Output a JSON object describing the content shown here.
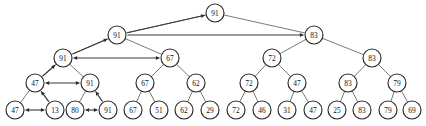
{
  "figure": {
    "name": "binary-heap-percolate-diagram",
    "background": "#ffffff",
    "node_fill": "#ffffff",
    "node_stroke": "#2b2b2b",
    "edge_color": "#6b6b6b",
    "arrow_color": "#2b2b2b",
    "node_radius": 9,
    "width": 426,
    "height": 126
  },
  "nodes": [
    {
      "id": "n0",
      "label": "91",
      "x": 215,
      "y": 13,
      "level": 1
    },
    {
      "id": "n1",
      "label": "91",
      "x": 117,
      "y": 35,
      "level": 2
    },
    {
      "id": "n2",
      "label": "83",
      "x": 314,
      "y": 35,
      "level": 2
    },
    {
      "id": "n3",
      "label": "91",
      "x": 63,
      "y": 58,
      "level": 3
    },
    {
      "id": "n4",
      "label": "67",
      "x": 170,
      "y": 58,
      "level": 3
    },
    {
      "id": "n5",
      "label": "72",
      "x": 272,
      "y": 58,
      "level": 3
    },
    {
      "id": "n6",
      "label": "83",
      "x": 372,
      "y": 58,
      "level": 3
    },
    {
      "id": "n7",
      "label": "47",
      "x": 35,
      "y": 83,
      "level": 4
    },
    {
      "id": "n8",
      "label": "91",
      "x": 90,
      "y": 83,
      "level": 4
    },
    {
      "id": "n9",
      "label": "67",
      "x": 145,
      "y": 83,
      "level": 4
    },
    {
      "id": "n10",
      "label": "62",
      "x": 196,
      "y": 83,
      "level": 4
    },
    {
      "id": "n11",
      "label": "72",
      "x": 249,
      "y": 83,
      "level": 4
    },
    {
      "id": "n12",
      "label": "47",
      "x": 297,
      "y": 83,
      "level": 4
    },
    {
      "id": "n13",
      "label": "83",
      "x": 348,
      "y": 83,
      "level": 4
    },
    {
      "id": "n14",
      "label": "79",
      "x": 397,
      "y": 83,
      "level": 4
    },
    {
      "id": "n15",
      "label": "47",
      "x": 15,
      "y": 110,
      "level": 5
    },
    {
      "id": "n16",
      "label": "13",
      "x": 55,
      "y": 110,
      "level": 5
    },
    {
      "id": "n17",
      "label": "80",
      "x": 75,
      "y": 110,
      "level": 5
    },
    {
      "id": "n18",
      "label": "91",
      "x": 108,
      "y": 110,
      "level": 5
    },
    {
      "id": "n19",
      "label": "67",
      "x": 133,
      "y": 110,
      "level": 5
    },
    {
      "id": "n20",
      "label": "51",
      "x": 159,
      "y": 110,
      "level": 5
    },
    {
      "id": "n21",
      "label": "62",
      "x": 184,
      "y": 110,
      "level": 5
    },
    {
      "id": "n22",
      "label": "29",
      "x": 210,
      "y": 110,
      "level": 5
    },
    {
      "id": "n23",
      "label": "72",
      "x": 236,
      "y": 110,
      "level": 5
    },
    {
      "id": "n24",
      "label": "46",
      "x": 262,
      "y": 110,
      "level": 5
    },
    {
      "id": "n25",
      "label": "31",
      "x": 287,
      "y": 110,
      "level": 5
    },
    {
      "id": "n26",
      "label": "47",
      "x": 313,
      "y": 110,
      "level": 5
    },
    {
      "id": "n27",
      "label": "25",
      "x": 337,
      "y": 110,
      "level": 5
    },
    {
      "id": "n28",
      "label": "83",
      "x": 362,
      "y": 110,
      "level": 5
    },
    {
      "id": "n29",
      "label": "79",
      "x": 388,
      "y": 110,
      "level": 5
    },
    {
      "id": "n30",
      "label": "69",
      "x": 412,
      "y": 110,
      "level": 5
    }
  ],
  "edges": [
    {
      "from": "n0",
      "to": "n1"
    },
    {
      "from": "n0",
      "to": "n2"
    },
    {
      "from": "n1",
      "to": "n3"
    },
    {
      "from": "n1",
      "to": "n4"
    },
    {
      "from": "n2",
      "to": "n5"
    },
    {
      "from": "n2",
      "to": "n6"
    },
    {
      "from": "n3",
      "to": "n7"
    },
    {
      "from": "n3",
      "to": "n8"
    },
    {
      "from": "n4",
      "to": "n9"
    },
    {
      "from": "n4",
      "to": "n10"
    },
    {
      "from": "n5",
      "to": "n11"
    },
    {
      "from": "n5",
      "to": "n12"
    },
    {
      "from": "n6",
      "to": "n13"
    },
    {
      "from": "n6",
      "to": "n14"
    },
    {
      "from": "n7",
      "to": "n15"
    },
    {
      "from": "n7",
      "to": "n16"
    },
    {
      "from": "n8",
      "to": "n17"
    },
    {
      "from": "n8",
      "to": "n18"
    },
    {
      "from": "n9",
      "to": "n19"
    },
    {
      "from": "n9",
      "to": "n20"
    },
    {
      "from": "n10",
      "to": "n21"
    },
    {
      "from": "n10",
      "to": "n22"
    },
    {
      "from": "n11",
      "to": "n23"
    },
    {
      "from": "n11",
      "to": "n24"
    },
    {
      "from": "n12",
      "to": "n25"
    },
    {
      "from": "n12",
      "to": "n26"
    },
    {
      "from": "n13",
      "to": "n27"
    },
    {
      "from": "n13",
      "to": "n28"
    },
    {
      "from": "n14",
      "to": "n29"
    },
    {
      "from": "n14",
      "to": "n30"
    }
  ],
  "arrows": [
    {
      "name": "swap-47-13",
      "from": "n15",
      "to": "n16",
      "heads": "both",
      "style": "horizontal"
    },
    {
      "name": "swap-80-91",
      "from": "n17",
      "to": "n18",
      "heads": "both",
      "style": "horizontal"
    },
    {
      "name": "swap-47-91",
      "from": "n7",
      "to": "n8",
      "heads": "both",
      "style": "horizontal"
    },
    {
      "name": "swap-91-67",
      "from": "n3",
      "to": "n4",
      "heads": "both",
      "style": "horizontal"
    },
    {
      "name": "swap-91-83",
      "from": "n2",
      "to": "n1",
      "heads": "start",
      "style": "horizontal"
    },
    {
      "name": "percolate-13-to-47",
      "from": "n16",
      "to": "n7",
      "heads": "end",
      "style": "diagonal"
    },
    {
      "name": "percolate-91-to-91",
      "from": "n18",
      "to": "n8",
      "heads": "end",
      "style": "diagonal"
    },
    {
      "name": "percolate-47-to-91",
      "from": "n7",
      "to": "n3",
      "heads": "end",
      "style": "diagonal"
    },
    {
      "name": "percolate-91-to-91b",
      "from": "n3",
      "to": "n1",
      "heads": "end",
      "style": "diagonal"
    },
    {
      "name": "percolate-91-to-root",
      "from": "n1",
      "to": "n0",
      "heads": "end",
      "style": "diagonal"
    }
  ]
}
